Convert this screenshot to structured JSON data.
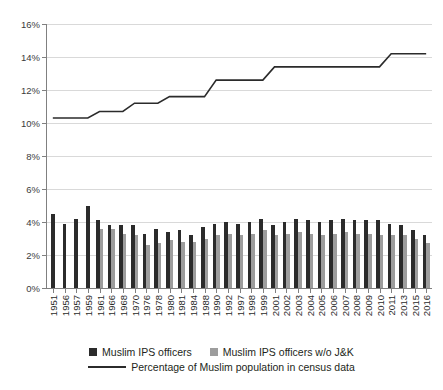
{
  "chart_data": {
    "type": "bar",
    "title": "",
    "subtitle": "",
    "xlabel": "",
    "ylabel": "",
    "ylim": [
      0,
      16
    ],
    "ytick_labels": [
      "16%",
      "14%",
      "12%",
      "10%",
      "8%",
      "6%",
      "4%",
      "2%",
      "0%"
    ],
    "ytick_values": [
      16,
      14,
      12,
      10,
      8,
      6,
      4,
      2,
      0
    ],
    "grid": true,
    "legend_position": "bottom",
    "categories": [
      "1951",
      "1956",
      "1957",
      "1959",
      "1961",
      "1966",
      "1968",
      "1970",
      "1976",
      "1978",
      "1980",
      "1981",
      "1984",
      "1988",
      "1990",
      "1992",
      "1997",
      "1998",
      "1999",
      "2001",
      "2002",
      "2003",
      "2004",
      "2005",
      "2006",
      "2007",
      "2008",
      "2009",
      "2010",
      "2011",
      "2013",
      "2015",
      "2016"
    ],
    "series": [
      {
        "name": "Muslim IPS officers",
        "color": "#2b2b2b",
        "type": "bar",
        "values": [
          4.5,
          3.9,
          4.2,
          5.0,
          4.1,
          3.8,
          3.8,
          3.8,
          3.3,
          3.6,
          3.4,
          3.5,
          3.2,
          3.7,
          3.9,
          4.0,
          3.9,
          4.0,
          4.2,
          3.8,
          4.0,
          4.2,
          4.1,
          4.0,
          4.1,
          4.2,
          4.1,
          4.1,
          4.1,
          3.9,
          3.8,
          3.5,
          3.2
        ]
      },
      {
        "name": "Muslim IPS officers w/o J&K",
        "color": "#9d9d9d",
        "type": "bar",
        "values": [
          null,
          null,
          null,
          null,
          3.6,
          3.6,
          3.3,
          3.2,
          2.6,
          2.7,
          2.9,
          2.8,
          2.8,
          3.0,
          3.2,
          3.3,
          3.2,
          3.3,
          3.5,
          3.2,
          3.3,
          3.4,
          3.3,
          3.2,
          3.3,
          3.4,
          3.3,
          3.3,
          3.2,
          3.2,
          3.2,
          3.0,
          2.7
        ]
      },
      {
        "name": "Percentage of Muslim population in census data",
        "color": "#2b2b2b",
        "type": "line",
        "values": [
          10.3,
          10.3,
          10.3,
          10.3,
          10.7,
          10.7,
          10.7,
          11.2,
          11.2,
          11.2,
          11.6,
          11.6,
          11.6,
          11.6,
          12.6,
          12.6,
          12.6,
          12.6,
          12.6,
          13.4,
          13.4,
          13.4,
          13.4,
          13.4,
          13.4,
          13.4,
          13.4,
          13.4,
          13.4,
          14.2,
          14.2,
          14.2,
          14.2
        ]
      }
    ],
    "legend": [
      {
        "label": "Muslim IPS officers",
        "marker": "square",
        "color": "#2b2b2b"
      },
      {
        "label": "Muslim IPS officers w/o J&K",
        "marker": "square",
        "color": "#9d9d9d"
      },
      {
        "label": "Percentage of Muslim population in census data",
        "marker": "line",
        "color": "#2b2b2b"
      }
    ]
  }
}
